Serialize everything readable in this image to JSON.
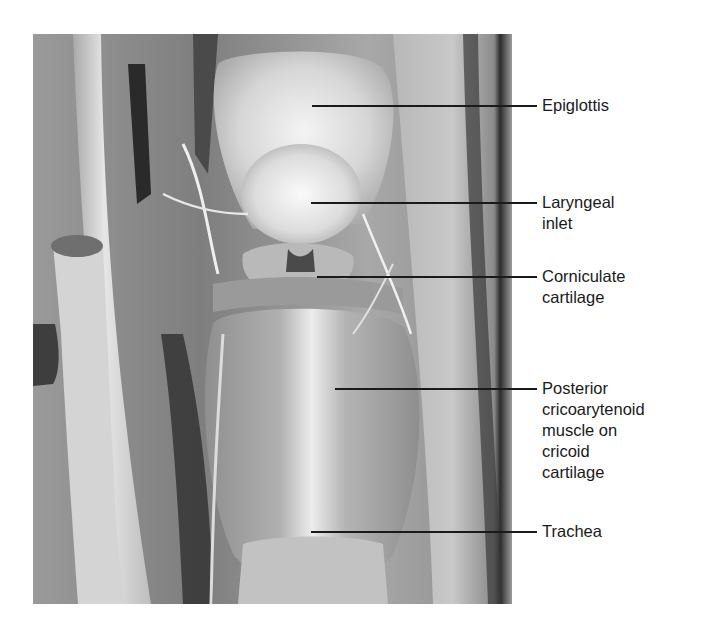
{
  "figure": {
    "labels": [
      {
        "id": "epiglottis",
        "text": "Epiglottis",
        "line_y": 106,
        "line_x_start": 312,
        "text_top": 96
      },
      {
        "id": "laryngeal-inlet",
        "text": "Laryngeal\ninlet",
        "line_y": 203,
        "line_x_start": 311,
        "text_top": 193
      },
      {
        "id": "corniculate-cartilage",
        "text": "Corniculate\ncartilage",
        "line_y": 277,
        "line_x_start": 317,
        "text_top": 267
      },
      {
        "id": "posterior-cricoarytenoid",
        "text": "Posterior\ncricoarytenoid\nmuscle on\ncricoid\ncartilage",
        "line_y": 389,
        "line_x_start": 335,
        "text_top": 379
      },
      {
        "id": "trachea",
        "text": "Trachea",
        "line_y": 532,
        "line_x_start": 311,
        "text_top": 522
      }
    ],
    "line_x_end": 537,
    "colors": {
      "label_text": "#1a1a1a",
      "leader_line": "#1a1a1a",
      "background": "#ffffff"
    }
  }
}
